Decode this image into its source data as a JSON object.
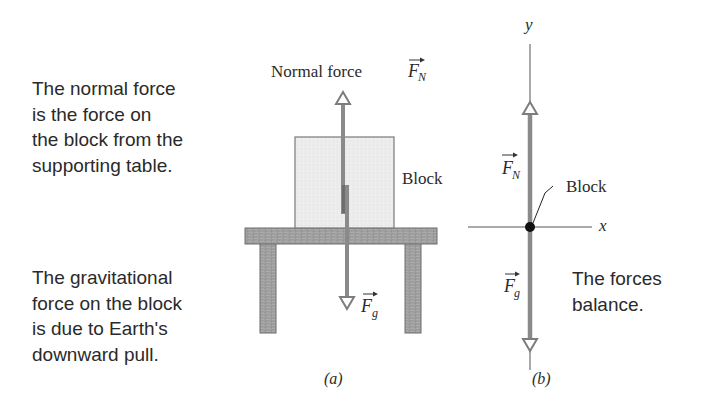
{
  "captions": {
    "normal_force": "The normal force\nis the force on\nthe block from the\nsupporting table.",
    "gravitational_force": "The gravitational\nforce on the block\nis due to Earth's\ndownward pull.",
    "forces_balance": "The forces\nbalance."
  },
  "panel_a": {
    "normal_force_label": "Normal force",
    "normal_force_symbol": "F",
    "normal_force_subscript": "N",
    "block_label": "Block",
    "gravity_symbol": "F",
    "gravity_subscript": "g",
    "panel_label": "(a)"
  },
  "panel_b": {
    "y_axis_label": "y",
    "x_axis_label": "x",
    "normal_symbol": "F",
    "normal_subscript": "N",
    "gravity_symbol": "F",
    "gravity_subscript": "g",
    "block_label": "Block",
    "panel_label": "(b)"
  },
  "colors": {
    "arrow": "#8a8a8a",
    "block_fill": "#ececec",
    "block_stroke": "#7a7a7a",
    "table_fill": "#9a9a9a",
    "axis": "#555555",
    "dot": "#111111"
  }
}
